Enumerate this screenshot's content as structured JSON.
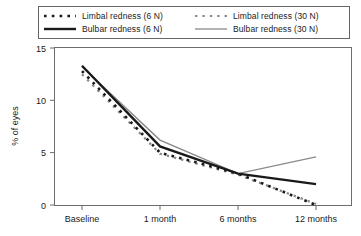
{
  "chart_data": {
    "type": "line",
    "title": "",
    "xlabel": "",
    "ylabel": "% of eyes",
    "categories": [
      "Baseline",
      "1 month",
      "6 months",
      "12 months"
    ],
    "ylim": [
      0,
      15
    ],
    "yticks": [
      0,
      5,
      10,
      15
    ],
    "ytick_labels": [
      "0",
      "5",
      "10",
      "15"
    ],
    "grid": false,
    "legend_position": "top",
    "series": [
      {
        "name": "Limbal redness (6 N)",
        "style": "dotted-thick",
        "color": "#1a1a1a",
        "values": [
          12.8,
          5.0,
          3.0,
          0.0
        ]
      },
      {
        "name": "Limbal redness (30 N)",
        "style": "solid-thick",
        "color": "#1a1a1a",
        "values": [
          13.3,
          5.6,
          3.0,
          2.0
        ]
      },
      {
        "name": "Bulbar redness (6 N)",
        "style": "dotted-thin",
        "color": "#8a8a8a",
        "values": [
          12.5,
          4.9,
          2.9,
          0.1
        ]
      },
      {
        "name": "Bulbar redness (30 N)",
        "style": "solid-thin",
        "color": "#8a8a8a",
        "values": [
          13.2,
          6.2,
          3.0,
          4.6
        ]
      }
    ]
  },
  "legend": {
    "entries": [
      {
        "label": "Limbal redness (6 N)",
        "icon": "dotted-thick-line-icon"
      },
      {
        "label": "Bulbar redness (6 N)",
        "icon": "dotted-thin-line-icon"
      },
      {
        "label": "Limbal redness (30 N)",
        "icon": "solid-thick-line-icon"
      },
      {
        "label": "Bulbar redness (30 N)",
        "icon": "solid-thin-line-icon"
      }
    ]
  },
  "axes": {
    "y_title": "% of eyes",
    "y_labels": [
      "15",
      "10",
      "5",
      "0"
    ],
    "x_labels": [
      "Baseline",
      "1 month",
      "6 months",
      "12 months"
    ]
  },
  "colors": {
    "series_dark": "#1a1a1a",
    "series_gray": "#8a8a8a",
    "axis": "#6d6d6d",
    "background": "#ffffff"
  }
}
